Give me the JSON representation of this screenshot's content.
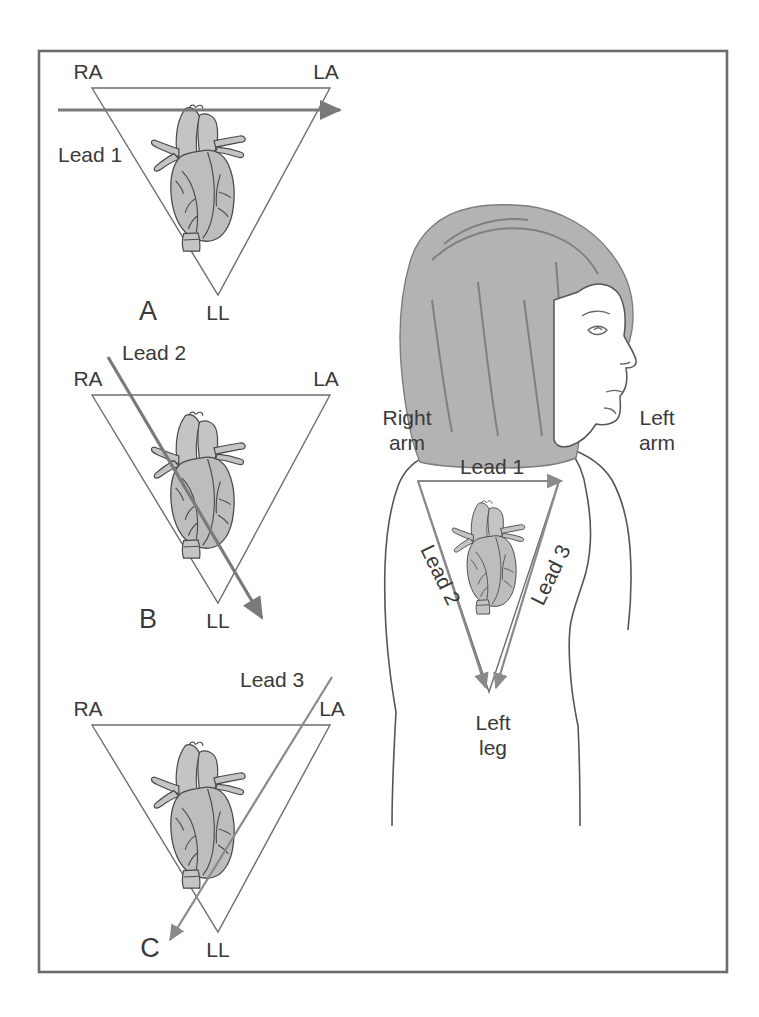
{
  "figure": {
    "border_color": "#6b6b6b",
    "background_color": "#ffffff"
  },
  "panels": [
    {
      "id": "A",
      "label": "A",
      "vertices": {
        "right_arm": "RA",
        "left_arm": "LA",
        "left_leg": "LL"
      },
      "lead": {
        "name": "Lead 1",
        "direction": "horizontal right",
        "from_vertex": "RA",
        "to_vertex": "LA"
      }
    },
    {
      "id": "B",
      "label": "B",
      "vertices": {
        "right_arm": "RA",
        "left_arm": "LA",
        "left_leg": "LL"
      },
      "lead": {
        "name": "Lead 2",
        "direction": "diagonal down-right",
        "from_vertex": "RA",
        "to_vertex": "LL"
      }
    },
    {
      "id": "C",
      "label": "C",
      "vertices": {
        "right_arm": "RA",
        "left_arm": "LA",
        "left_leg": "LL"
      },
      "lead": {
        "name": "Lead 3",
        "direction": "diagonal down-left",
        "from_vertex": "LA",
        "to_vertex": "LL"
      }
    }
  ],
  "torso": {
    "right_arm_line1": "Right",
    "right_arm_line2": "arm",
    "left_arm_line1": "Left",
    "left_arm_line2": "arm",
    "left_leg_line1": "Left",
    "left_leg_line2": "leg",
    "leads": [
      {
        "name": "Lead 1",
        "direction": "horizontal right",
        "rotation": 0
      },
      {
        "name": "Lead 2",
        "direction": "diagonal down-right",
        "rotation": 64
      },
      {
        "name": "Lead 3",
        "direction": "diagonal down-left",
        "rotation": -64
      }
    ]
  },
  "colors": {
    "heart_fill": "#bdbdbd",
    "heart_stroke": "#4a4a4a",
    "hair_fill": "#b3b3b3",
    "triangle_stroke": "#6e6e6e",
    "arrow_stroke": "#7a7a7a",
    "text": "#3a3a3a"
  }
}
